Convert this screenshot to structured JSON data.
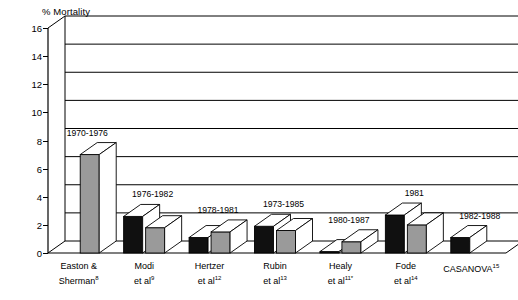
{
  "chart_data": {
    "type": "bar",
    "title": "",
    "ylabel": "% Mortality",
    "xlabel": "",
    "ylim": [
      0,
      16
    ],
    "yticks": [
      0,
      2,
      4,
      6,
      8,
      10,
      12,
      14,
      16
    ],
    "grid": true,
    "legend_position": "none",
    "style": "3d-grouped-bars",
    "categories": [
      "Easton & Sherman",
      "Modi et al",
      "Hertzer et al",
      "Rubin et al",
      "Healy et al",
      "Fode et al",
      "CASANOVA"
    ],
    "category_refs": [
      "8",
      "9",
      "12",
      "13",
      "11*",
      "14",
      "15"
    ],
    "annotations": [
      "1970-1976",
      "1976-1982",
      "1978-1981",
      "1973-1985",
      "1980-1987",
      "1981",
      "1982-1988"
    ],
    "series": [
      {
        "name": "black",
        "color": "#101010",
        "values": [
          null,
          2.6,
          1.1,
          1.9,
          0.1,
          2.7,
          1.1
        ]
      },
      {
        "name": "grey",
        "color": "#9a9a9a",
        "values": [
          7.0,
          1.8,
          1.5,
          1.6,
          0.8,
          2.0,
          null
        ]
      }
    ]
  },
  "axis": {
    "title": "% Mortality",
    "ticks": [
      "16",
      "14",
      "12",
      "10",
      "8",
      "6",
      "4",
      "2",
      "0"
    ]
  },
  "groups": [
    {
      "id": "easton-sherman",
      "date": "1970-1976",
      "label_line1": "Easton &",
      "label_line2": "Sherman",
      "ref": "8",
      "black": null,
      "grey": 7.0
    },
    {
      "id": "modi",
      "date": "1976-1982",
      "label_line1": "Modi",
      "label_line2": "et al",
      "ref": "9",
      "black": 2.6,
      "grey": 1.8
    },
    {
      "id": "hertzer",
      "date": "1978-1981",
      "label_line1": "Hertzer",
      "label_line2": "et al",
      "ref": "12",
      "black": 1.1,
      "grey": 1.5
    },
    {
      "id": "rubin",
      "date": "1973-1985",
      "label_line1": "Rubin",
      "label_line2": "et al",
      "ref": "13",
      "black": 1.9,
      "grey": 1.6
    },
    {
      "id": "healy",
      "date": "1980-1987",
      "label_line1": "Healy",
      "label_line2": "et al",
      "ref": "11*",
      "black": 0.1,
      "grey": 0.8
    },
    {
      "id": "fode",
      "date": "1981",
      "label_line1": "Fode",
      "label_line2": "et al",
      "ref": "14",
      "black": 2.7,
      "grey": 2.0
    },
    {
      "id": "casanova",
      "date": "1982-1988",
      "label_line1": "CASANOVA",
      "label_line2": "",
      "ref": "15",
      "black": 1.1,
      "grey": null
    }
  ],
  "colors": {
    "black_bar": "#101010",
    "grey_bar": "#9a9a9a",
    "axis": "#000000",
    "background": "#ffffff"
  }
}
